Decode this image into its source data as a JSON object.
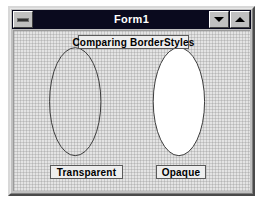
{
  "window": {
    "title": "Form1",
    "control_box": {
      "name": "control-menu-box",
      "glyph": "horizontal-bar"
    },
    "buttons": [
      {
        "name": "minimize",
        "glyph": "arrow-down"
      },
      {
        "name": "maximize",
        "glyph": "arrow-up"
      }
    ]
  },
  "form": {
    "background": "#e4e4e4",
    "titlebar_color": "#0a0a1e",
    "titlebar_text_color": "#ffffff",
    "frame_color": "#c0c0c0"
  },
  "labels": {
    "heading": "Comparing BorderStyles",
    "left": "Transparent",
    "right": "Opaque"
  },
  "shapes": {
    "outline_color": "#3a3a3a",
    "left_ellipse": {
      "name": "transparent-ellipse",
      "cx": 62,
      "cy": 72,
      "rx": 26,
      "ry": 55,
      "fill": "none",
      "stroke_width": 1
    },
    "right_ellipse": {
      "name": "opaque-ellipse",
      "cx": 167,
      "cy": 72,
      "rx": 26,
      "ry": 55,
      "fill": "#ffffff",
      "stroke_width": 1
    }
  }
}
